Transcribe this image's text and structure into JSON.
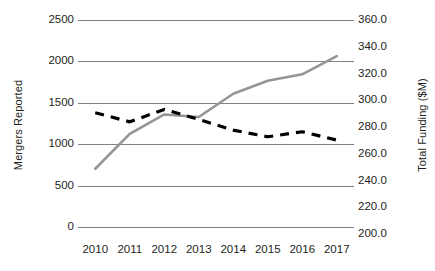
{
  "chart_data": {
    "type": "line",
    "title": "",
    "xlabel": "",
    "categories": [
      "2010",
      "2011",
      "2012",
      "2013",
      "2014",
      "2015",
      "2016",
      "2017"
    ],
    "grid": true,
    "legend": "none",
    "axes": {
      "left": {
        "label": "Mergers Reported",
        "ticks": [
          "2500",
          "2000",
          "1500",
          "1000",
          "500",
          "0"
        ],
        "tick_values": [
          2500,
          2000,
          1500,
          1000,
          500,
          0
        ],
        "min": 0,
        "max": 2500
      },
      "right": {
        "label": "Total Funding ($M)",
        "ticks": [
          "360.0",
          "340.0",
          "320.0",
          "300.0",
          "280.0",
          "260.0",
          "240.0",
          "220.0",
          "200.0"
        ],
        "tick_values": [
          360.0,
          340.0,
          320.0,
          300.0,
          280.0,
          260.0,
          240.0,
          220.0,
          200.0
        ],
        "min": 200.0,
        "max": 360.0
      }
    },
    "series": [
      {
        "name": "Mergers Reported",
        "axis": "left",
        "style": "dashed",
        "color": "#000000",
        "values": [
          1380,
          1270,
          1420,
          1300,
          1170,
          1090,
          1150,
          1050
        ]
      },
      {
        "name": "Total Funding ($M)",
        "axis": "right",
        "style": "solid",
        "color": "#939598",
        "values": [
          245.0,
          272.0,
          287.0,
          285.0,
          303.0,
          313.0,
          318.0,
          332.0
        ]
      }
    ]
  }
}
